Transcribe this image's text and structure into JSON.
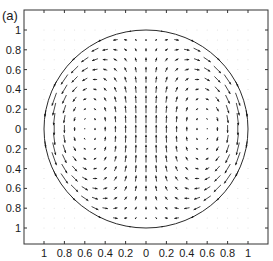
{
  "chart_data": {
    "type": "quiver",
    "panel_label": "(a)",
    "title": "",
    "xlabel": "",
    "ylabel": "",
    "xlim": [
      -1.2,
      1.2
    ],
    "ylim": [
      -1.2,
      1.2
    ],
    "x_ticks": [
      -1,
      -0.8,
      -0.6,
      -0.4,
      -0.2,
      0,
      0.2,
      0.4,
      0.6,
      0.8,
      1
    ],
    "x_tick_labels": [
      "1",
      "0.8",
      "0.6",
      "0.4",
      "0.2",
      "0",
      "0.2",
      "0.4",
      "0.6",
      "0.8",
      "1"
    ],
    "y_ticks": [
      1,
      0.8,
      0.6,
      0.4,
      0.2,
      0,
      -0.2,
      -0.4,
      -0.6,
      -0.8,
      -1
    ],
    "y_tick_labels": [
      "1",
      "0.8",
      "0.6",
      "0.4",
      "0.2",
      "0",
      "0.2",
      "0.4",
      "0.6",
      "0.8",
      "1"
    ],
    "grid": false,
    "legend": null,
    "boundary": {
      "shape": "circle",
      "center": [
        0,
        0
      ],
      "radius": 1
    },
    "field": {
      "description": "Two counter-rotating vortices inside unit circle; upward flow along center line, downward flow along left and right boundary",
      "grid_step": 0.1,
      "grid_range": [
        -1.0,
        1.0
      ],
      "stream_function": "psi = -x(1 - x^2 - y^2)",
      "u": "2xy",
      "v": "1 - 3x^2 - y^2",
      "center_velocity": [
        0,
        1
      ],
      "left_vortex_rotation": "counterclockwise",
      "right_vortex_rotation": "clockwise",
      "boundary_arrow_count": 20
    },
    "colors": {
      "arrows": "#1a1a1a",
      "circle": "#2a2a2a",
      "axes": "#333333",
      "outside_dots": "#d8d8d8"
    }
  }
}
